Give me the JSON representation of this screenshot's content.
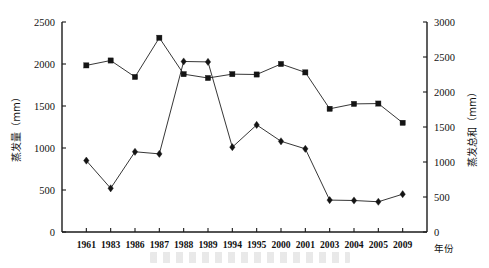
{
  "chart_data": {
    "type": "line",
    "title": "",
    "xlabel": "年份",
    "categories": [
      "1961",
      "1983",
      "1986",
      "1987",
      "1988",
      "1989",
      "1994",
      "1995",
      "2000",
      "2001",
      "2003",
      "2004",
      "2005",
      "2009"
    ],
    "grid": false,
    "legend": "none",
    "axes": {
      "left": {
        "label": "蒸发量（mm）",
        "unit": "mm",
        "ticks": [
          0,
          500,
          1000,
          1500,
          2000,
          2500
        ],
        "ylim": [
          0,
          2500
        ]
      },
      "right": {
        "label": "蒸发总和（mm）",
        "unit": "mm",
        "ticks": [
          0,
          500,
          1000,
          1500,
          2000,
          2500,
          3000
        ],
        "ylim": [
          0,
          3000
        ]
      }
    },
    "series": [
      {
        "name": "蒸发总和",
        "marker": "square",
        "axis": "right",
        "values": [
          2380,
          2450,
          2215,
          2775,
          2255,
          2200,
          2255,
          2250,
          2400,
          2280,
          1760,
          1830,
          1835,
          1560
        ]
      },
      {
        "name": "蒸发量",
        "marker": "diamond",
        "axis": "left",
        "values": [
          850,
          520,
          955,
          930,
          2030,
          2025,
          1010,
          1275,
          1080,
          990,
          380,
          375,
          360,
          450
        ]
      }
    ]
  }
}
